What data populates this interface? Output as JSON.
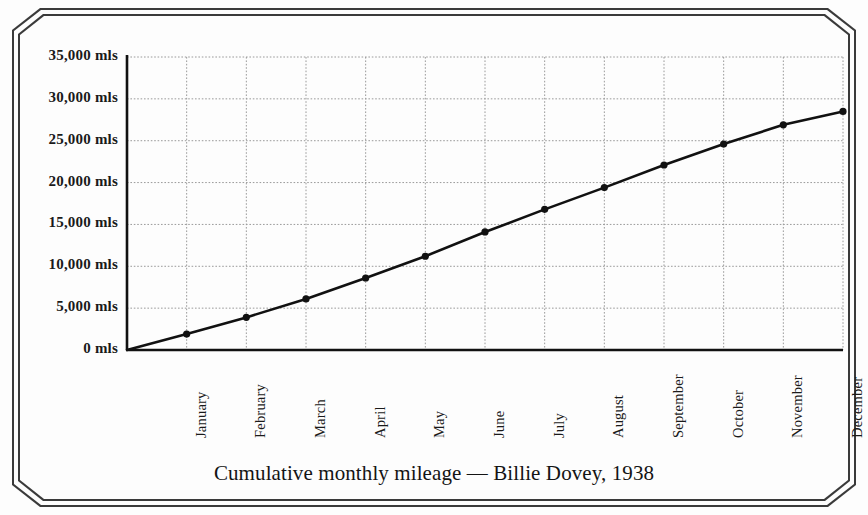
{
  "caption": "Cumulative monthly mileage — Billie Dovey, 1938",
  "colors": {
    "frame": "#3a3a3a",
    "axis": "#111111",
    "grid": "#9a9a9a",
    "line": "#111111",
    "marker": "#111111",
    "background": "#fdfdfd",
    "text": "#1a1a1a"
  },
  "y_axis": {
    "tick_labels": [
      "0 mls",
      "5,000 mls",
      "10,000 mls",
      "15,000 mls",
      "20,000 mls",
      "25,000 mls",
      "30,000 mls",
      "35,000 mls"
    ]
  },
  "chart_data": {
    "type": "line",
    "title": "Cumulative monthly mileage — Billie Dovey, 1938",
    "xlabel": "",
    "ylabel": "",
    "unit": "mls",
    "categories": [
      "January",
      "February",
      "March",
      "April",
      "May",
      "June",
      "July",
      "August",
      "September",
      "October",
      "November",
      "December"
    ],
    "values": [
      1900,
      3900,
      6100,
      8600,
      11200,
      14100,
      16800,
      19400,
      22100,
      24600,
      26900,
      28500
    ],
    "origin_value": 0,
    "ylim": [
      0,
      35000
    ],
    "ytick_step": 5000,
    "yticks": [
      0,
      5000,
      10000,
      15000,
      20000,
      25000,
      30000,
      35000
    ],
    "ytick_labels": [
      "0 mls",
      "5,000 mls",
      "10,000 mls",
      "15,000 mls",
      "20,000 mls",
      "25,000 mls",
      "30,000 mls",
      "35,000 mls"
    ],
    "grid": true,
    "grid_style": "dotted",
    "legend": false,
    "markers": "filled-circle",
    "xtick_rotation": -90
  }
}
